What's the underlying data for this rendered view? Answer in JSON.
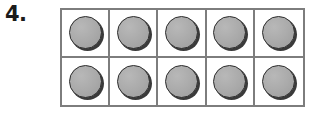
{
  "worksheet": {
    "problem_number": "4.",
    "background_color": "#ffffff"
  },
  "ten_frame": {
    "name": "ten-frame",
    "columns": 5,
    "rows": 2,
    "border_color": "#7d7d7d",
    "cell_fill_color": "#ffffff",
    "total_cells": 10,
    "filled_count": 10,
    "empty_count": 0,
    "counter": {
      "shape": "circle",
      "fill_color": "#a9a9a9",
      "outline_color": "#2e2e2e",
      "shadow_color": "#3a3a3a"
    },
    "cells": [
      {
        "row": 1,
        "column": 1,
        "filled": true,
        "label": "counter"
      },
      {
        "row": 1,
        "column": 2,
        "filled": true,
        "label": "counter"
      },
      {
        "row": 1,
        "column": 3,
        "filled": true,
        "label": "counter"
      },
      {
        "row": 1,
        "column": 4,
        "filled": true,
        "label": "counter"
      },
      {
        "row": 1,
        "column": 5,
        "filled": true,
        "label": "counter"
      },
      {
        "row": 2,
        "column": 1,
        "filled": true,
        "label": "counter"
      },
      {
        "row": 2,
        "column": 2,
        "filled": true,
        "label": "counter"
      },
      {
        "row": 2,
        "column": 3,
        "filled": true,
        "label": "counter"
      },
      {
        "row": 2,
        "column": 4,
        "filled": true,
        "label": "counter"
      },
      {
        "row": 2,
        "column": 5,
        "filled": true,
        "label": "counter"
      }
    ]
  }
}
